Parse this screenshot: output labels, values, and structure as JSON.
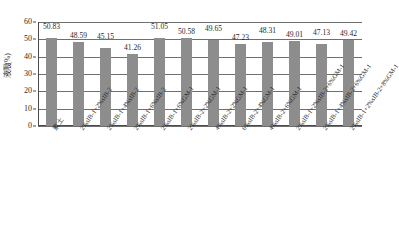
{
  "chart_data": {
    "type": "bar",
    "title": "",
    "xlabel": "",
    "ylabel": "液限(%)",
    "ylim": [
      0,
      60
    ],
    "ytick_step": 10,
    "grid": true,
    "legend": "none",
    "bar_color": "#8d8d8d",
    "categories": [
      "素土",
      "2%sIB-1+2%sIB-2",
      "2%sIB-1+4%sIB-2",
      "2%sIB-1+6%sIB-2",
      "2%sIB-1+6%GM-1",
      "2%sIB-2+2%GM-1",
      "4%sIB-2+2%GM-1",
      "6%sIB-2+4%GM-1",
      "4%sIB-2+6%GM-1",
      "2%sIB-1+2%sIB-2+6%GM-1",
      "2%sIB-1+4%sIB-2+6%GM-1",
      "2%sIB-1+2%sIB-2+8%GM-1"
    ],
    "values": [
      50.83,
      48.59,
      45.15,
      41.26,
      51.05,
      50.58,
      49.65,
      47.23,
      48.31,
      49.01,
      47.13,
      49.42
    ],
    "value_labels": [
      "50.83",
      "48.59",
      "45.15",
      "41.26",
      "51.05",
      "50.58",
      "49.65",
      "47.23",
      "48.31",
      "49.01",
      "47.13",
      "49.42"
    ],
    "ytick_labels": [
      "60",
      "50",
      "40",
      "30",
      "20",
      "10",
      "0"
    ],
    "ytick_values": [
      60,
      50,
      40,
      30,
      20,
      10,
      0
    ]
  }
}
